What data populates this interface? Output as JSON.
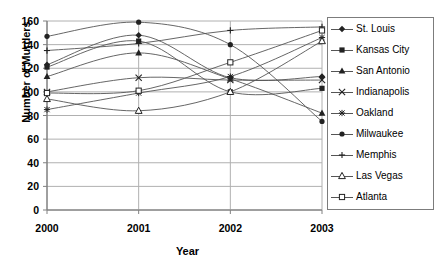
{
  "chart_data": {
    "type": "line",
    "title": "",
    "xlabel": "Year",
    "ylabel": "Number of Murders",
    "x": [
      "2000",
      "2001",
      "2002",
      "2003"
    ],
    "categories": [
      "2000",
      "2001",
      "2002",
      "2003"
    ],
    "xlim": [
      2000,
      2003
    ],
    "ylim": [
      0,
      160
    ],
    "ytick_labels": [
      "0",
      "20",
      "40",
      "60",
      "80",
      "100",
      "120",
      "140",
      "160"
    ],
    "ytick_values": [
      0,
      20,
      40,
      60,
      80,
      100,
      120,
      140,
      160
    ],
    "grid": "horizontal-and-vertical",
    "legend_position": "right",
    "series": [
      {
        "name": "St. Louis",
        "marker": "diamond",
        "values": [
          123,
          148,
          112,
          113
        ]
      },
      {
        "name": "Kansas City",
        "marker": "square",
        "values": [
          121,
          143,
          100,
          103
        ]
      },
      {
        "name": "San Antonio",
        "marker": "triangle",
        "values": [
          113,
          133,
          111,
          82
        ]
      },
      {
        "name": "Indianapolis",
        "marker": "x-cross",
        "values": [
          100,
          112,
          110,
          110
        ]
      },
      {
        "name": "Oakland",
        "marker": "asterisk",
        "values": [
          85,
          99,
          113,
          146
        ]
      },
      {
        "name": "Milwaukee",
        "marker": "circle",
        "values": [
          147,
          159,
          140,
          75
        ]
      },
      {
        "name": "Memphis",
        "marker": "plus",
        "values": [
          135,
          141,
          152,
          155
        ]
      },
      {
        "name": "Las Vegas",
        "marker": "triangle-open",
        "values": [
          94,
          84,
          100,
          143
        ]
      },
      {
        "name": "Atlanta",
        "marker": "square-open",
        "values": [
          99,
          101,
          125,
          152
        ]
      }
    ]
  },
  "axes": {
    "y_title": "Number of Murders",
    "x_title": "Year"
  },
  "colors": {
    "line": "#555555",
    "marker": "#222222",
    "axis": "#808080",
    "grid": "#b0b0b0",
    "text": "#000000",
    "background": "#ffffff"
  },
  "legend": {
    "items": [
      {
        "label": "St. Louis"
      },
      {
        "label": "Kansas City"
      },
      {
        "label": "San Antonio"
      },
      {
        "label": "Indianapolis"
      },
      {
        "label": "Oakland"
      },
      {
        "label": "Milwaukee"
      },
      {
        "label": "Memphis"
      },
      {
        "label": "Las Vegas"
      },
      {
        "label": "Atlanta"
      }
    ]
  }
}
